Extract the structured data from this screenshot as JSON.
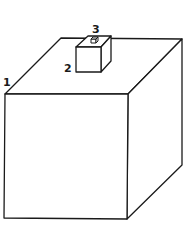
{
  "diagram": {
    "labels": [
      {
        "id": "1",
        "text": "1",
        "refers_to": "large-cube"
      },
      {
        "id": "2",
        "text": "2",
        "refers_to": "medium-cube"
      },
      {
        "id": "3",
        "text": "3",
        "refers_to": "small-cube"
      }
    ],
    "colors": {
      "line": "#1a1a1a",
      "background": "#ffffff"
    }
  }
}
